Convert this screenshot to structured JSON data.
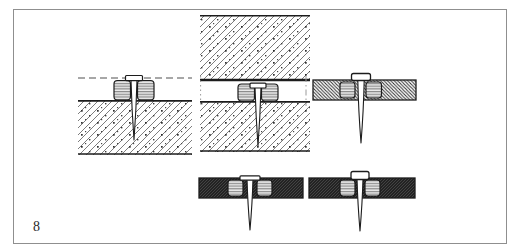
{
  "figure": {
    "label": "8"
  },
  "colors": {
    "paper": "#ffffff",
    "ink": "#1c1c1c",
    "frame_border": "#8f8f8f",
    "label": "#2a2a2a",
    "masonry_hatch": "#6e6e6e",
    "board_hatch": "#2d2d2d",
    "dark_board": "#232323",
    "plug_fill": "#ececec",
    "plug_line": "#555555",
    "plaster_dash": "#8a8a8a"
  },
  "diagrams": [
    {
      "name": "plug-in-masonry-under-plaster"
    },
    {
      "name": "plug-in-cavity-between-masonry-layers"
    },
    {
      "name": "plug-in-thin-board"
    },
    {
      "name": "plug-flush-in-thin-dark-board"
    },
    {
      "name": "plug-proud-in-thin-dark-board"
    }
  ]
}
